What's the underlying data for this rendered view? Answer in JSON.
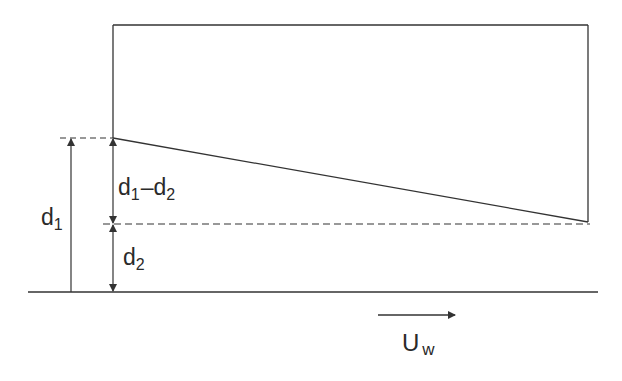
{
  "diagram": {
    "type": "engineering-schematic",
    "colors": {
      "stroke": "#333333",
      "text": "#2a2a2a",
      "background": "#ffffff"
    },
    "labels": {
      "d1": {
        "main": "d",
        "sub": "1"
      },
      "d1_minus_d2": {
        "a": "d",
        "a_sub": "1",
        "op": "–",
        "b": "d",
        "b_sub": "2"
      },
      "d2": {
        "main": "d",
        "sub": "2"
      },
      "velocity": {
        "main": "U",
        "sub": "w"
      }
    },
    "geometry": {
      "box": {
        "x1": 113,
        "y1": 25,
        "x2": 588,
        "y2": 222
      },
      "sloped_line": {
        "from": [
          113,
          138
        ],
        "to": [
          588,
          222
        ]
      },
      "top_dashed_line_y": 138,
      "mid_dashed_line_y": 224,
      "ground_line_y": 292,
      "velocity_arrow": {
        "from": [
          378,
          315
        ],
        "to": [
          455,
          315
        ]
      }
    }
  }
}
